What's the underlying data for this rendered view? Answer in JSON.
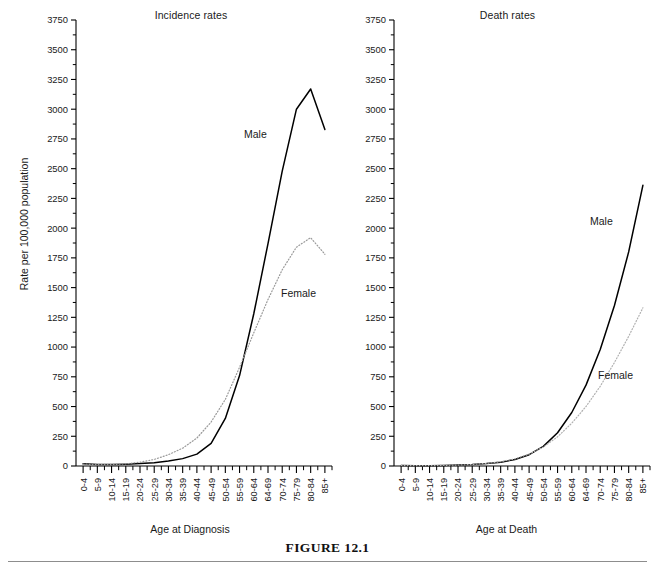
{
  "figure": {
    "caption": "FIGURE 12.1"
  },
  "charts": [
    {
      "key": "incidence",
      "title": "Incidence rates",
      "xlabel": "Age at Diagnosis",
      "ylabel": "Rate per 100,000 population",
      "male_label": "Male",
      "female_label": "Female"
    },
    {
      "key": "death",
      "title": "Death rates",
      "xlabel": "Age at Death",
      "male_label": "Male",
      "female_label": "Female"
    }
  ],
  "chart_data": [
    {
      "type": "line",
      "title": "Incidence rates",
      "xlabel": "Age at Diagnosis",
      "ylabel": "Rate per 100,000 population",
      "ylim": [
        0,
        3750
      ],
      "yticks": [
        0,
        250,
        500,
        750,
        1000,
        1250,
        1500,
        1750,
        2000,
        2250,
        2500,
        2750,
        3000,
        3250,
        3500,
        3750
      ],
      "ytick_step": 250,
      "yminor_step": 125,
      "grid": false,
      "legend": "inline-annotations",
      "categories": [
        "0-4",
        "5-9",
        "10-14",
        "15-19",
        "20-24",
        "25-29",
        "30-34",
        "35-39",
        "40-44",
        "45-49",
        "50-54",
        "55-59",
        "60-64",
        "64-69",
        "70-74",
        "75-79",
        "80-84",
        "85+"
      ],
      "series": [
        {
          "name": "Male",
          "style": "solid",
          "color": "#000000",
          "values": [
            18,
            12,
            12,
            15,
            20,
            28,
            42,
            62,
            100,
            190,
            400,
            760,
            1280,
            1870,
            2480,
            3000,
            3170,
            2830
          ]
        },
        {
          "name": "Female",
          "style": "dotted",
          "color": "#9a9a9a",
          "values": [
            16,
            11,
            12,
            18,
            32,
            55,
            95,
            150,
            235,
            370,
            560,
            830,
            1120,
            1400,
            1650,
            1840,
            1920,
            1780
          ]
        }
      ]
    },
    {
      "type": "line",
      "title": "Death rates",
      "xlabel": "Age at Death",
      "ylim": [
        0,
        3750
      ],
      "yticks": [
        0,
        250,
        500,
        750,
        1000,
        1250,
        1500,
        1750,
        2000,
        2250,
        2500,
        2750,
        3000,
        3250,
        3500,
        3750
      ],
      "ytick_step": 250,
      "yminor_step": 125,
      "grid": false,
      "legend": "inline-annotations",
      "categories": [
        "0-4",
        "5-9",
        "10-14",
        "15-19",
        "20-24",
        "25-29",
        "30-34",
        "35-39",
        "40-44",
        "45-49",
        "50-54",
        "55-59",
        "60-64",
        "64-69",
        "70-74",
        "75-79",
        "80-84",
        "85+"
      ],
      "series": [
        {
          "name": "Male",
          "style": "solid",
          "color": "#000000",
          "values": [
            5,
            3,
            3,
            5,
            8,
            12,
            20,
            32,
            55,
            95,
            165,
            280,
            450,
            680,
            980,
            1350,
            1800,
            2360
          ]
        },
        {
          "name": "Female",
          "style": "dotted",
          "color": "#b0b0b0",
          "values": [
            4,
            3,
            3,
            5,
            8,
            13,
            22,
            36,
            60,
            100,
            160,
            245,
            360,
            500,
            670,
            870,
            1090,
            1330
          ]
        }
      ]
    }
  ]
}
